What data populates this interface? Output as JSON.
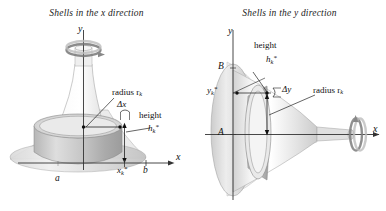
{
  "figure": {
    "width": 386,
    "height": 211,
    "background": "#ffffff",
    "ink": "#1a1a1a",
    "surface_light": "#f2f2f2",
    "surface_mid": "#d8d8d8",
    "surface_dark": "#b9b9b9",
    "line": "#555555"
  },
  "panels": [
    {
      "id": "x-direction",
      "title": "Shells in the x direction",
      "axis_of_revolution": "y",
      "labels": {
        "y_axis": "y",
        "x_axis": "x",
        "radius": "radius r",
        "radius_sub": "k",
        "delta": "Δx",
        "height_word": "height",
        "height_sym": "h",
        "height_sub": "k",
        "height_star": "*",
        "sample_point": "x",
        "sample_point_sub": "k",
        "sample_point_star": "*",
        "left_bound": "a",
        "right_bound": "b"
      }
    },
    {
      "id": "y-direction",
      "title": "Shells in the y direction",
      "axis_of_revolution": "x",
      "labels": {
        "y_axis": "y",
        "x_axis": "x",
        "radius": "radius r",
        "radius_sub": "k",
        "delta": "Δy",
        "height_word": "height",
        "height_sym": "h",
        "height_sub": "k",
        "height_star": "*",
        "sample_point": "y",
        "sample_point_sub": "k",
        "sample_point_star": "*",
        "upper_bound": "B",
        "lower_bound": "A"
      }
    }
  ]
}
